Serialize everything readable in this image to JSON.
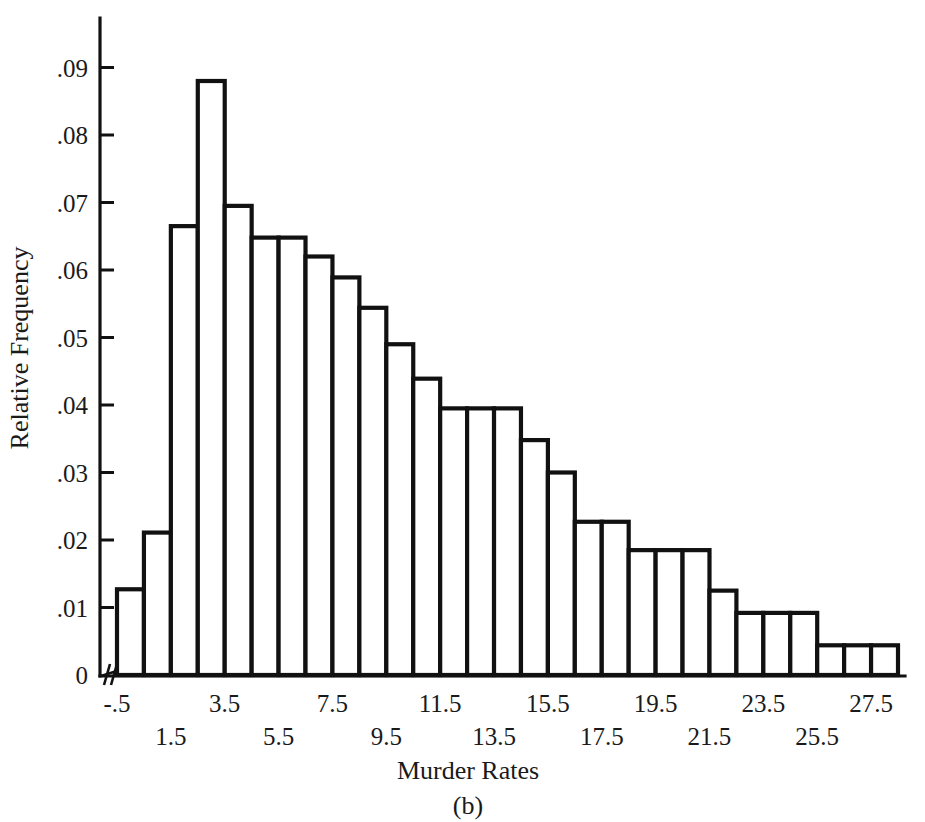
{
  "chart_data": {
    "type": "bar",
    "title": "",
    "panel_label": "(b)",
    "xlabel": "Murder Rates",
    "ylabel": "Relative Frequency",
    "grid": false,
    "legend": "none",
    "axis_break": true,
    "ylim": [
      0,
      0.095
    ],
    "xlim": [
      -1.5,
      28.5
    ],
    "bin_width": 1,
    "ytick_labels": [
      "0",
      ".01",
      ".02",
      ".03",
      ".04",
      ".05",
      ".06",
      ".07",
      ".08",
      ".09"
    ],
    "ytick_values": [
      0,
      0.01,
      0.02,
      0.03,
      0.04,
      0.05,
      0.06,
      0.07,
      0.08,
      0.09
    ],
    "xtick_labels": [
      "-.5",
      "1.5",
      "3.5",
      "5.5",
      "7.5",
      "9.5",
      "11.5",
      "13.5",
      "15.5",
      "17.5",
      "19.5",
      "21.5",
      "23.5",
      "25.5",
      "27.5"
    ],
    "xtick_values": [
      -0.5,
      1.5,
      3.5,
      5.5,
      7.5,
      9.5,
      11.5,
      13.5,
      15.5,
      17.5,
      19.5,
      21.5,
      23.5,
      25.5,
      27.5
    ],
    "bin_left_edges": [
      -0.5,
      0.5,
      1.5,
      2.5,
      3.5,
      4.5,
      5.5,
      6.5,
      7.5,
      8.5,
      9.5,
      10.5,
      11.5,
      12.5,
      13.5,
      14.5,
      15.5,
      16.5,
      17.5,
      18.5,
      19.5,
      20.5,
      21.5,
      22.5,
      23.5,
      24.5,
      25.5,
      26.5,
      27.5
    ],
    "categories": [
      "0",
      "1",
      "2",
      "3",
      "4",
      "5",
      "6",
      "7",
      "8",
      "9",
      "10",
      "11",
      "12",
      "13",
      "14",
      "15",
      "16",
      "17",
      "18",
      "19",
      "20",
      "21",
      "22",
      "23",
      "24",
      "25",
      "26",
      "27",
      "28"
    ],
    "values": [
      0.0127,
      0.0211,
      0.0665,
      0.088,
      0.0695,
      0.0648,
      0.0648,
      0.062,
      0.0589,
      0.0544,
      0.049,
      0.0439,
      0.0395,
      0.0395,
      0.0395,
      0.0348,
      0.03,
      0.0227,
      0.0227,
      0.0185,
      0.0185,
      0.0185,
      0.0125,
      0.0092,
      0.0092,
      0.0092,
      0.0044,
      0.0044,
      0.0044
    ],
    "colors": {
      "bar_fill": "#ffffff",
      "bar_stroke": "#111111",
      "axis": "#111111",
      "text": "#1a1a1a",
      "background": "#ffffff"
    }
  }
}
